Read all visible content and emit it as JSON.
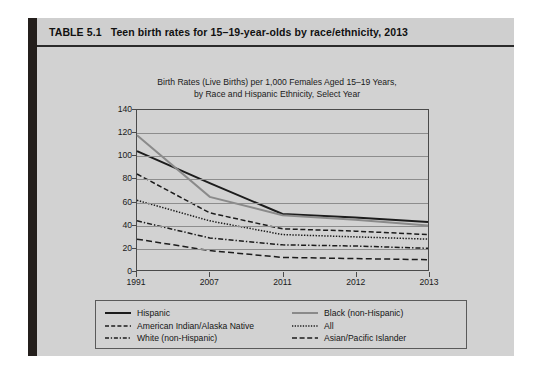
{
  "table": {
    "number": "TABLE 5.1",
    "caption": "Teen birth rates for 15–19-year-olds by race/ethnicity, 2013"
  },
  "chart_data": {
    "type": "line",
    "title": "Birth Rates (Live Births) per 1,000 Females Aged 15–19 Years, by Race and Hispanic Ethnicity, Select Year",
    "title_line1": "Birth Rates (Live Births) per 1,000 Females Aged 15–19 Years,",
    "title_line2": "by Race and Hispanic Ethnicity, Select Year",
    "xlabel": "",
    "ylabel": "",
    "categories": [
      "1991",
      "2007",
      "2011",
      "2012",
      "2013"
    ],
    "x_tick_labels": [
      "1991",
      "2007",
      "2011",
      "2012",
      "2013"
    ],
    "y_tick_labels": [
      "0",
      "20",
      "40",
      "60",
      "80",
      "100",
      "120",
      "140"
    ],
    "ylim": [
      0,
      140
    ],
    "y_step": 20,
    "grid": "horizontal",
    "legend_position": "below-plot",
    "series": [
      {
        "name": "Hispanic",
        "values": [
          104,
          76,
          49,
          46,
          42
        ],
        "color": "#1c1c1c",
        "style": "solid",
        "width": 2.0
      },
      {
        "name": "Black (non-Hispanic)",
        "values": [
          118,
          64,
          48,
          44,
          39
        ],
        "color": "#8a8a8a",
        "style": "solid",
        "width": 2.0
      },
      {
        "name": "American Indian/Alaska Native",
        "values": [
          84,
          50,
          36,
          34,
          31
        ],
        "color": "#1c1c1c",
        "style": "dashed",
        "width": 1.5
      },
      {
        "name": "All",
        "values": [
          61,
          43,
          31,
          29,
          27
        ],
        "color": "#1c1c1c",
        "style": "dotted-fine",
        "width": 1.5
      },
      {
        "name": "White (non-Hispanic)",
        "values": [
          43,
          28,
          22,
          21,
          19
        ],
        "color": "#1c1c1c",
        "style": "dash-dot",
        "width": 1.5
      },
      {
        "name": "Asian/Pacific Islander",
        "values": [
          27,
          17,
          11,
          10,
          9
        ],
        "color": "#1c1c1c",
        "style": "dashed-long",
        "width": 1.5
      }
    ],
    "legend_left": [
      {
        "label": "Hispanic",
        "swatch": "solid-black"
      },
      {
        "label": "American Indian/Alaska Native",
        "swatch": "dashed-black"
      },
      {
        "label": "White (non-Hispanic)",
        "swatch": "dash-dot-black"
      }
    ],
    "legend_right": [
      {
        "label": "Black (non-Hispanic)",
        "swatch": "solid-gray"
      },
      {
        "label": "All",
        "swatch": "dotted-fine-black"
      },
      {
        "label": "Asian/Pacific Islander",
        "swatch": "dashed-long-black"
      }
    ]
  },
  "colors": {
    "page_background": "#ffffff",
    "table_background": "#d2d2d2",
    "table_header": "#cfcfcf",
    "left_bar": "#241f1c",
    "axis": "#4a4a4a",
    "gridline": "#8d8d8d",
    "text": "#1a1a1a",
    "series_black": "#1c1c1c",
    "series_gray": "#8a8a8a"
  }
}
